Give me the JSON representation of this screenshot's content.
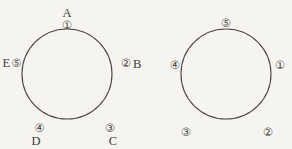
{
  "figure": {
    "background_color": "#f6f4f1",
    "stroke_color": "#4a4643",
    "text_color": "#3f3b38",
    "type": "two-circle-point-diagram",
    "circles": [
      {
        "id": "left-circle",
        "cx": 67,
        "cy": 74,
        "r": 45,
        "points": [
          {
            "key": "top",
            "letter": "A",
            "number": "①",
            "arrangement": "letter-above-number",
            "angle_deg": 90,
            "lx": 67,
            "ly": 12,
            "nx": 67,
            "ny": 23
          },
          {
            "key": "right",
            "letter": "B",
            "number": "②",
            "arrangement": "number-then-letter",
            "angle_deg": 22,
            "lx": 137,
            "ly": 62,
            "nx": 126,
            "ny": 62
          },
          {
            "key": "bottom-right",
            "letter": "C",
            "number": "③",
            "arrangement": "number-above-letter",
            "angle_deg": -38,
            "lx": 113,
            "ly": 139,
            "nx": 105,
            "ny": 128
          },
          {
            "key": "bottom-left",
            "letter": "D",
            "number": "④",
            "arrangement": "number-above-letter",
            "angle_deg": -140,
            "lx": 30,
            "ly": 139,
            "nx": 38,
            "ny": 128
          },
          {
            "key": "left",
            "letter": "E",
            "number": "⑤",
            "arrangement": "letter-then-number",
            "angle_deg": 170,
            "lx": 6,
            "ly": 62,
            "nx": 17,
            "ny": 62
          }
        ]
      },
      {
        "id": "right-circle",
        "cx": 226,
        "cy": 74,
        "r": 45,
        "points": [
          {
            "key": "top",
            "letter": "",
            "number": "⑤",
            "arrangement": "number-only",
            "angle_deg": 95,
            "nx": 226,
            "ny": 21
          },
          {
            "key": "right",
            "letter": "",
            "number": "①",
            "arrangement": "number-only",
            "angle_deg": 8,
            "nx": 281,
            "ny": 64
          },
          {
            "key": "bottom-right",
            "letter": "",
            "number": "②",
            "arrangement": "number-only",
            "angle_deg": -52,
            "nx": 269,
            "ny": 131
          },
          {
            "key": "bottom-left",
            "letter": "",
            "number": "③",
            "arrangement": "number-only",
            "angle_deg": -128,
            "nx": 186,
            "ny": 131
          },
          {
            "key": "left",
            "letter": "",
            "number": "④",
            "arrangement": "number-only",
            "angle_deg": 172,
            "nx": 174,
            "ny": 64
          }
        ]
      }
    ],
    "labels": {
      "l_top_letter": "A",
      "l_top_num": "①",
      "l_right_num": "②",
      "l_right_letter": "B",
      "l_br_num": "③",
      "l_br_letter": "C",
      "l_bl_num": "④",
      "l_bl_letter": "D",
      "l_left_letter": "E",
      "l_left_num": "⑤",
      "r_top_num": "⑤",
      "r_right_num": "①",
      "r_br_num": "②",
      "r_bl_num": "③",
      "r_left_num": "④"
    }
  }
}
